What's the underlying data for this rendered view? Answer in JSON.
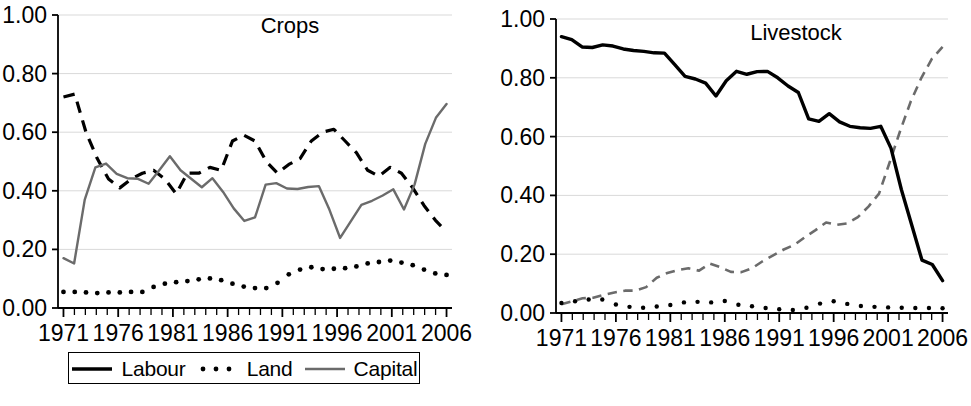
{
  "figure": {
    "background": "#ffffff",
    "panel_count": 2
  },
  "colors": {
    "black": "#000000",
    "gray": "#6b6b6b",
    "gridline": "#d9d9d9",
    "axis": "#000000"
  },
  "chart_data": [
    {
      "type": "line",
      "title": "Crops",
      "xlabel": "",
      "ylabel": "",
      "xlim": [
        1970.5,
        2006.5
      ],
      "ylim": [
        0.0,
        1.0
      ],
      "grid": true,
      "legend_position": "bottom",
      "ytick_labels": [
        "0.00",
        "0.20",
        "0.40",
        "0.60",
        "0.80",
        "1.00"
      ],
      "ytick_values": [
        0.0,
        0.2,
        0.4,
        0.6,
        0.8,
        1.0
      ],
      "xtick_labels": [
        "1971",
        "1976",
        "1981",
        "1986",
        "1991",
        "1996",
        "2001",
        "2006"
      ],
      "xtick_values": [
        1971,
        1976,
        1981,
        1986,
        1991,
        1996,
        2001,
        2006
      ],
      "x": [
        1971,
        1972,
        1973,
        1974,
        1975,
        1976,
        1977,
        1978,
        1979,
        1980,
        1981,
        1982,
        1983,
        1984,
        1985,
        1986,
        1987,
        1988,
        1989,
        1990,
        1991,
        1992,
        1993,
        1994,
        1995,
        1996,
        1997,
        1998,
        1999,
        2000,
        2001,
        2002,
        2003,
        2004,
        2005
      ],
      "series": [
        {
          "name": "Labour",
          "style": "dashed",
          "color": "#000000",
          "width": 3.2,
          "values": [
            0.72,
            0.73,
            0.6,
            0.51,
            0.44,
            0.41,
            0.44,
            0.46,
            0.47,
            0.44,
            0.39,
            0.46,
            0.46,
            0.48,
            0.47,
            0.57,
            0.59,
            0.57,
            0.5,
            0.46,
            0.49,
            0.51,
            0.57,
            0.6,
            0.61,
            0.57,
            0.53,
            0.47,
            0.45,
            0.48,
            0.46,
            0.41,
            0.35,
            0.3,
            0.26
          ]
        },
        {
          "name": "Land",
          "style": "dotted",
          "color": "#000000",
          "width": 4,
          "values": [
            0.055,
            0.055,
            0.053,
            0.051,
            0.053,
            0.053,
            0.055,
            0.055,
            0.072,
            0.083,
            0.088,
            0.092,
            0.098,
            0.101,
            0.095,
            0.083,
            0.073,
            0.068,
            0.068,
            0.086,
            0.115,
            0.131,
            0.139,
            0.133,
            0.134,
            0.136,
            0.142,
            0.152,
            0.157,
            0.162,
            0.155,
            0.146,
            0.131,
            0.118,
            0.113
          ]
        },
        {
          "name": "Capital",
          "style": "solid",
          "color": "#6b6b6b",
          "width": 2.4,
          "values": [
            0.17,
            0.152,
            0.37,
            0.48,
            0.493,
            0.458,
            0.443,
            0.441,
            0.424,
            0.47,
            0.518,
            0.47,
            0.441,
            0.412,
            0.443,
            0.396,
            0.34,
            0.297,
            0.309,
            0.421,
            0.426,
            0.408,
            0.406,
            0.413,
            0.416,
            0.335,
            0.239,
            0.296,
            0.352,
            0.366,
            0.384,
            0.405,
            0.336,
            0.422,
            0.56,
            0.649,
            0.696
          ]
        }
      ]
    },
    {
      "type": "line",
      "title": "Livestock",
      "xlabel": "",
      "ylabel": "",
      "xlim": [
        1970.5,
        2006.5
      ],
      "ylim": [
        0.0,
        1.0
      ],
      "grid": true,
      "legend_position": "bottom",
      "ytick_labels": [
        "0.00",
        "0.20",
        "0.40",
        "0.60",
        "0.80",
        "1.00"
      ],
      "ytick_values": [
        0.0,
        0.2,
        0.4,
        0.6,
        0.8,
        1.0
      ],
      "xtick_labels": [
        "1971",
        "1976",
        "1981",
        "1986",
        "1991",
        "1996",
        "2001",
        "2006"
      ],
      "xtick_values": [
        1971,
        1976,
        1981,
        1986,
        1991,
        1996,
        2001,
        2006
      ],
      "x": [
        1971,
        1972,
        1973,
        1974,
        1975,
        1976,
        1977,
        1978,
        1979,
        1980,
        1981,
        1982,
        1983,
        1984,
        1985,
        1986,
        1987,
        1988,
        1989,
        1990,
        1991,
        1992,
        1993,
        1994,
        1995,
        1996,
        1997,
        1998,
        1999,
        2000,
        2001,
        2002,
        2003,
        2004,
        2005
      ],
      "series": [
        {
          "name": "Labour",
          "style": "dashed",
          "color": "#6b6b6b",
          "width": 2.6,
          "values": [
            0.03,
            0.04,
            0.05,
            0.052,
            0.062,
            0.07,
            0.076,
            0.076,
            0.088,
            0.12,
            0.136,
            0.146,
            0.152,
            0.144,
            0.168,
            0.156,
            0.14,
            0.139,
            0.152,
            0.176,
            0.196,
            0.216,
            0.232,
            0.258,
            0.282,
            0.308,
            0.3,
            0.305,
            0.326,
            0.362,
            0.406,
            0.512,
            0.62,
            0.72,
            0.8,
            0.865,
            0.905
          ]
        },
        {
          "name": "Land",
          "style": "dotted",
          "color": "#000000",
          "width": 3.6,
          "values": [
            0.034,
            0.04,
            0.046,
            0.046,
            0.029,
            0.021,
            0.018,
            0.022,
            0.027,
            0.036,
            0.038,
            0.036,
            0.041,
            0.028,
            0.023,
            0.017,
            0.013,
            0.01,
            0.018,
            0.032,
            0.04,
            0.031,
            0.024,
            0.021,
            0.019,
            0.018,
            0.017,
            0.017,
            0.016
          ]
        },
        {
          "name": "Capital",
          "style": "solid",
          "color": "#000000",
          "width": 3.4,
          "values": [
            0.94,
            0.93,
            0.905,
            0.903,
            0.912,
            0.908,
            0.898,
            0.893,
            0.89,
            0.885,
            0.884,
            0.845,
            0.805,
            0.796,
            0.782,
            0.738,
            0.79,
            0.822,
            0.812,
            0.821,
            0.822,
            0.8,
            0.772,
            0.75,
            0.66,
            0.652,
            0.678,
            0.65,
            0.635,
            0.63,
            0.628,
            0.635,
            0.56,
            0.42,
            0.3,
            0.18,
            0.165,
            0.11
          ]
        }
      ]
    }
  ],
  "panels": {
    "crops": {
      "title": "Crops",
      "legend": {
        "items": [
          {
            "label": "Labour",
            "style": "dashed",
            "color": "#000000"
          },
          {
            "label": "Land",
            "style": "dotted",
            "color": "#000000"
          },
          {
            "label": "Capital",
            "style": "solid",
            "color": "#6b6b6b"
          }
        ]
      }
    },
    "livestock": {
      "title": "Livestock",
      "legend": {
        "items": [
          {
            "label": "Labour",
            "style": "solid",
            "color": "#6b6b6b"
          },
          {
            "label": "Land",
            "style": "dotted",
            "color": "#000000"
          },
          {
            "label": "Capital",
            "style": "solid",
            "color": "#000000"
          }
        ]
      }
    }
  }
}
